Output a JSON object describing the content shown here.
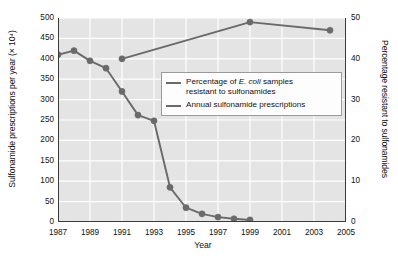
{
  "chart_data": {
    "type": "line",
    "title": "",
    "xlabel": "Year",
    "ylabel": "Sulfonamide prescriptions per year (× 10⁴)",
    "y2label": "Percentage resistant to sulfonamides",
    "xlim": [
      1987,
      2005
    ],
    "ylim": [
      0,
      500
    ],
    "y2lim": [
      0,
      50
    ],
    "xticks": [
      "1987",
      "1989",
      "1991",
      "1993",
      "1995",
      "1997",
      "1999",
      "2001",
      "2003",
      "2005"
    ],
    "xtick_values": [
      1987,
      1989,
      1991,
      1993,
      1995,
      1997,
      1999,
      2001,
      2003,
      2005
    ],
    "yticks": [
      "0",
      "50",
      "100",
      "150",
      "200",
      "250",
      "300",
      "350",
      "400",
      "450",
      "500"
    ],
    "ytick_values": [
      0,
      50,
      100,
      150,
      200,
      250,
      300,
      350,
      400,
      450,
      500
    ],
    "y2ticks": [
      "0",
      "10",
      "20",
      "30",
      "40",
      "50"
    ],
    "y2tick_values": [
      0,
      10,
      20,
      30,
      40,
      50
    ],
    "grid": true,
    "grid_color": "#ffffff",
    "plot_background": "#e4e4e4",
    "legend_position": "center",
    "series": [
      {
        "name": "Percentage of E. coli samples resistant to sulfonamides",
        "axis": "right",
        "color": "#6a6a6a",
        "marker": "circle",
        "x": [
          1991,
          1999,
          2004
        ],
        "values": [
          40,
          49,
          47
        ]
      },
      {
        "name": "Annual sulfonamide prescriptions",
        "axis": "left",
        "color": "#6a6a6a",
        "marker": "circle",
        "x": [
          1987,
          1988,
          1989,
          1990,
          1991,
          1992,
          1993,
          1994,
          1995,
          1996,
          1997,
          1998,
          1999
        ],
        "values": [
          410,
          420,
          395,
          377,
          320,
          262,
          248,
          85,
          35,
          20,
          12,
          8,
          5
        ]
      }
    ]
  },
  "legend": {
    "items": [
      {
        "line1_pre": "Percentage of ",
        "line1_italic": "E. coli",
        "line1_post": " samples",
        "line2": "resistant to sulfonamides"
      },
      {
        "line1_pre": "Annual sulfonamide prescriptions",
        "line1_italic": "",
        "line1_post": "",
        "line2": ""
      }
    ]
  }
}
